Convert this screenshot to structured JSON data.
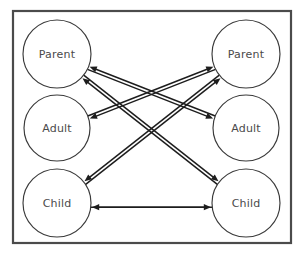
{
  "diagram": {
    "frame": {
      "x": 13,
      "y": 11,
      "width": 278,
      "height": 232,
      "stroke_color": "#4b4b4b",
      "fill_color": "#ffffff"
    },
    "background_color": "#ffffff",
    "label_color": "#4a4a4a",
    "circle_stroke_color": "#3a3a3a",
    "arrow_color": "#1d1d1d",
    "columns": [
      {
        "side": "left",
        "name": "person-a",
        "center_x": 57,
        "nodes": [
          {
            "id": "left-parent",
            "label": "Parent",
            "cx": 57,
            "cy": 54,
            "r": 34
          },
          {
            "id": "left-adult",
            "label": "Adult",
            "cx": 57,
            "cy": 128,
            "r": 33
          },
          {
            "id": "left-child",
            "label": "Child",
            "cx": 57,
            "cy": 203,
            "r": 34
          }
        ]
      },
      {
        "side": "right",
        "name": "person-b",
        "center_x": 246,
        "nodes": [
          {
            "id": "right-parent",
            "label": "Parent",
            "cx": 246,
            "cy": 54,
            "r": 34
          },
          {
            "id": "right-adult",
            "label": "Adult",
            "cx": 246,
            "cy": 128,
            "r": 33
          },
          {
            "id": "right-child",
            "label": "Child",
            "cx": 246,
            "cy": 203,
            "r": 34
          }
        ]
      }
    ],
    "transactions": [
      {
        "id": "t1",
        "name": "left-parent-to-right-child",
        "from": "left-parent",
        "to": "right-child",
        "direction": "left-to-right"
      },
      {
        "id": "t2",
        "name": "left-parent-to-right-adult",
        "from": "left-parent",
        "to": "right-adult",
        "direction": "left-to-right"
      },
      {
        "id": "t3",
        "name": "left-adult-to-right-parent",
        "from": "left-adult",
        "to": "right-parent",
        "direction": "left-to-right"
      },
      {
        "id": "t4",
        "name": "left-child-to-right-parent",
        "from": "left-child",
        "to": "right-parent",
        "direction": "left-to-right"
      },
      {
        "id": "t5",
        "name": "left-child-to-right-child",
        "from": "left-child",
        "to": "right-child",
        "direction": "left-to-right"
      },
      {
        "id": "t6",
        "name": "right-parent-to-left-child",
        "from": "right-parent",
        "to": "left-child",
        "direction": "right-to-left"
      },
      {
        "id": "t7",
        "name": "right-parent-to-left-adult",
        "from": "right-parent",
        "to": "left-adult",
        "direction": "right-to-left"
      },
      {
        "id": "t8",
        "name": "right-adult-to-left-parent",
        "from": "right-adult",
        "to": "left-parent",
        "direction": "right-to-left"
      },
      {
        "id": "t9",
        "name": "right-child-to-left-parent",
        "from": "right-child",
        "to": "left-parent",
        "direction": "right-to-left"
      },
      {
        "id": "t10",
        "name": "right-child-to-left-child",
        "from": "right-child",
        "to": "left-child",
        "direction": "right-to-left"
      }
    ]
  },
  "chart_data": {
    "type": "diagram",
    "nodes": [
      {
        "id": "left-parent",
        "label": "Parent",
        "column": "left"
      },
      {
        "id": "left-adult",
        "label": "Adult",
        "column": "left"
      },
      {
        "id": "left-child",
        "label": "Child",
        "column": "left"
      },
      {
        "id": "right-parent",
        "label": "Parent",
        "column": "right"
      },
      {
        "id": "right-adult",
        "label": "Adult",
        "column": "right"
      },
      {
        "id": "right-child",
        "label": "Child",
        "column": "right"
      }
    ],
    "edges": [
      [
        "left-parent",
        "right-child"
      ],
      [
        "left-parent",
        "right-adult"
      ],
      [
        "left-adult",
        "right-parent"
      ],
      [
        "left-child",
        "right-parent"
      ],
      [
        "left-child",
        "right-child"
      ],
      [
        "right-parent",
        "left-child"
      ],
      [
        "right-parent",
        "left-adult"
      ],
      [
        "right-adult",
        "left-parent"
      ],
      [
        "right-child",
        "left-parent"
      ],
      [
        "right-child",
        "left-child"
      ]
    ]
  }
}
